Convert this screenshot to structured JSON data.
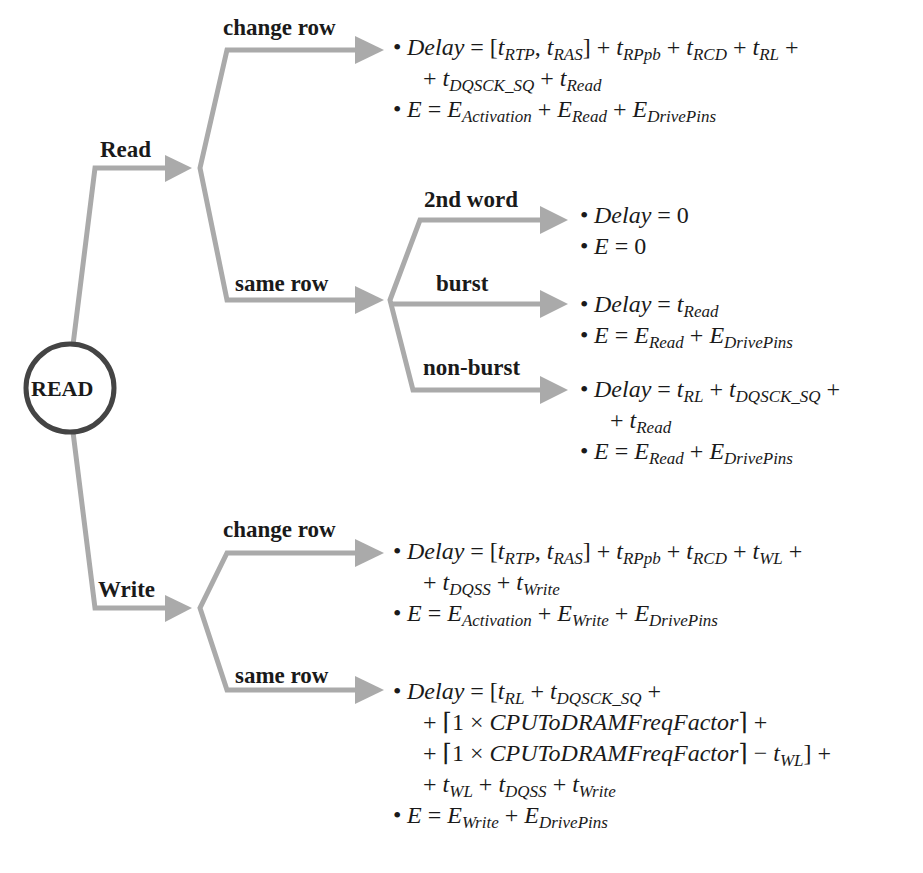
{
  "root": {
    "label": "READ"
  },
  "colors": {
    "arrow": "#aaaaaa",
    "circle_stroke": "#444444",
    "text": "#1a1a1a"
  },
  "branches": {
    "read": {
      "label": "Read",
      "change_row": {
        "label": "change row",
        "delay_line1": "[t_RTP, t_RAS] + t_RPpb + t_RCD + t_RL +",
        "delay_line2": "+ t_DQSCK_SQ + t_Read",
        "energy": "E_Activation + E_Read + E_DrivePins"
      },
      "same_row": {
        "label": "same row",
        "second_word": {
          "label": "2nd word",
          "delay": "0",
          "energy": "0"
        },
        "burst": {
          "label": "burst",
          "delay": "t_Read",
          "energy": "E_Read + E_DrivePins"
        },
        "non_burst": {
          "label": "non-burst",
          "delay_line1": "t_RL + t_DQSCK_SQ +",
          "delay_line2": "+ t_Read",
          "energy": "E_Read + E_DrivePins"
        }
      }
    },
    "write": {
      "label": "Write",
      "change_row": {
        "label": "change row",
        "delay_line1": "[t_RTP, t_RAS] + t_RPpb + t_RCD + t_WL +",
        "delay_line2": "+ t_DQSS + t_Write",
        "energy": "E_Activation + E_Write + E_DrivePins"
      },
      "same_row": {
        "label": "same row",
        "delay_line1": "[t_RL + t_DQSCK_SQ +",
        "delay_line2": "+ ⌈1 × CPUToDRAMFreqFactor⌉ +",
        "delay_line3": "+ ⌈1 × CPUToDRAMFreqFactor⌉ − t_WL] +",
        "delay_line4": "+ t_WL + t_DQSS + t_Write",
        "energy": "E_Write + E_DrivePins"
      }
    }
  },
  "symbols": {
    "bullet": "•",
    "delay": "Delay",
    "energy": "E",
    "eq": " = ",
    "plus": " + ",
    "minus": " − ",
    "t": "t",
    "zero": "0",
    "lbracket": "[",
    "rbracket": "]",
    "comma": ", ",
    "lceil": "⌈",
    "rceil": "⌉",
    "one_times": "1 × ",
    "factor": "CPUToDRAMFreqFactor",
    "sub": {
      "RTP": "RTP",
      "RAS": "RAS",
      "RPpb": "RPpb",
      "RCD": "RCD",
      "RL": "RL",
      "WL": "WL",
      "DQSCK_SQ": "DQSCK_SQ",
      "DQSS": "DQSS",
      "Read": "Read",
      "Write": "Write",
      "Activation": "Activation",
      "DrivePins": "DrivePins"
    }
  }
}
